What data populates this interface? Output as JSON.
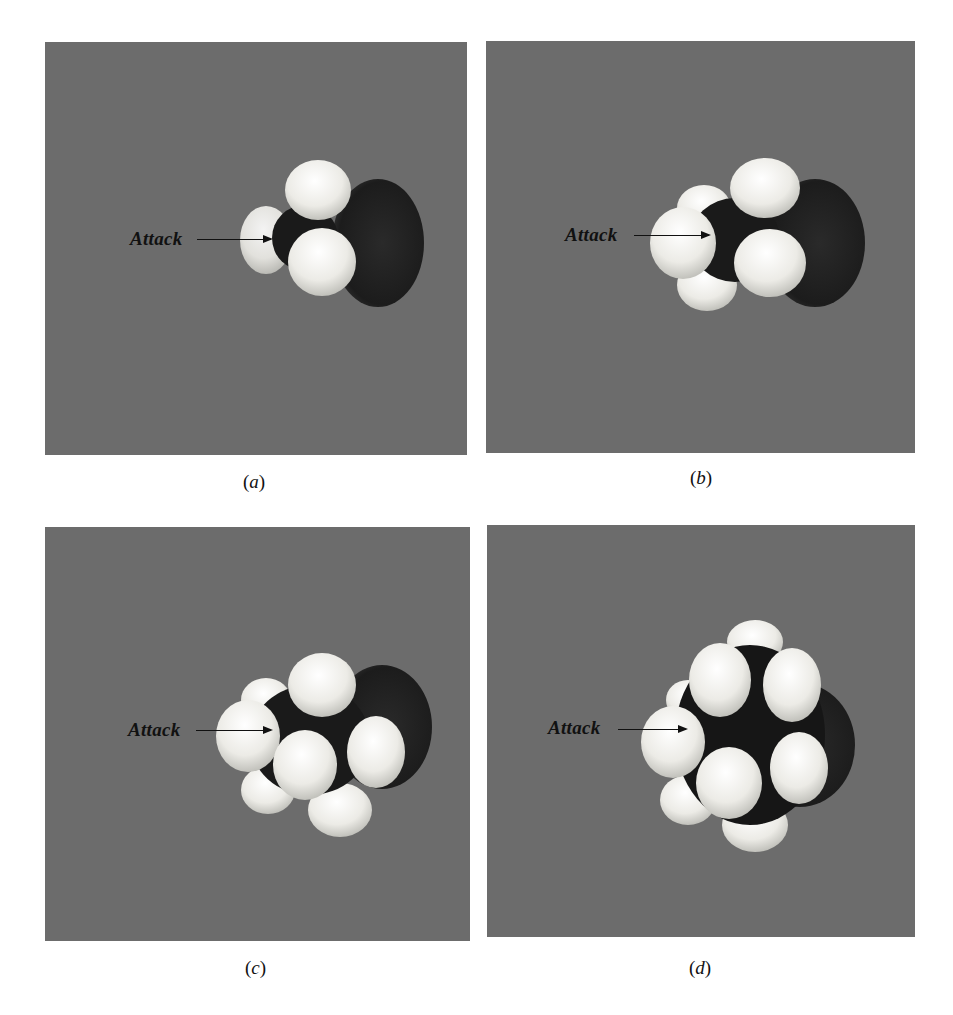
{
  "figure": {
    "background_color": "#6c6c6c",
    "atom_colors": {
      "hydrogen": "#f2f2ee",
      "heavy": "#1c1c1c"
    },
    "panels": [
      {
        "id": "a",
        "caption": "(a)",
        "caption_letter": "a",
        "label": "Attack",
        "box": [
          45,
          42,
          422,
          413
        ],
        "label_pos": [
          130,
          228
        ],
        "arrow": [
          197,
          239,
          74
        ]
      },
      {
        "id": "b",
        "caption": "(b)",
        "caption_letter": "b",
        "label": "Attack",
        "box": [
          486,
          41,
          429,
          412
        ],
        "label_pos": [
          565,
          224
        ],
        "arrow": [
          634,
          235,
          75
        ]
      },
      {
        "id": "c",
        "caption": "(c)",
        "caption_letter": "c",
        "label": "Attack",
        "box": [
          45,
          527,
          425,
          414
        ],
        "label_pos": [
          128,
          719
        ],
        "arrow": [
          196,
          730,
          75
        ]
      },
      {
        "id": "d",
        "caption": "(d)",
        "caption_letter": "d",
        "label": "Attack",
        "box": [
          487,
          525,
          428,
          412
        ],
        "label_pos": [
          548,
          717
        ],
        "arrow": [
          618,
          729,
          68
        ]
      }
    ]
  }
}
